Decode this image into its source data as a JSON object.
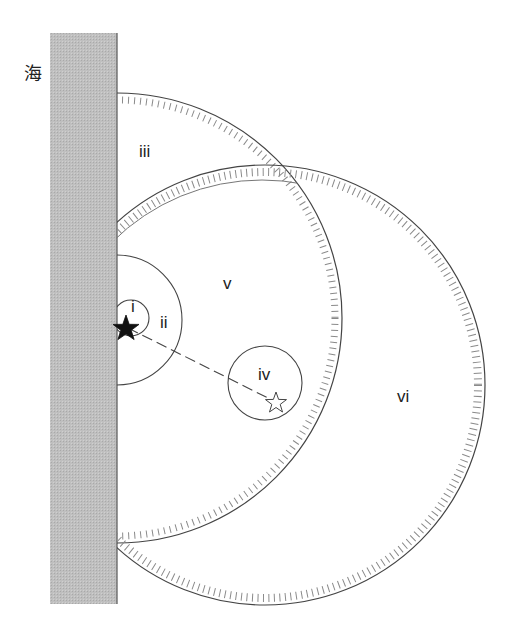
{
  "diagram": {
    "sea_label": "海",
    "regions": [
      {
        "id": "i",
        "label": "i"
      },
      {
        "id": "ii",
        "label": "ii"
      },
      {
        "id": "iii",
        "label": "iii"
      },
      {
        "id": "iv",
        "label": "iv"
      },
      {
        "id": "v",
        "label": "v"
      },
      {
        "id": "vi",
        "label": "vi"
      }
    ],
    "markers": {
      "filled_star": "black-star",
      "hollow_star": "white-star",
      "connector": "dashed-line"
    },
    "colors": {
      "wall": "#bdbdbd",
      "line": "#444444",
      "hatch": "#8a8a8a"
    }
  }
}
